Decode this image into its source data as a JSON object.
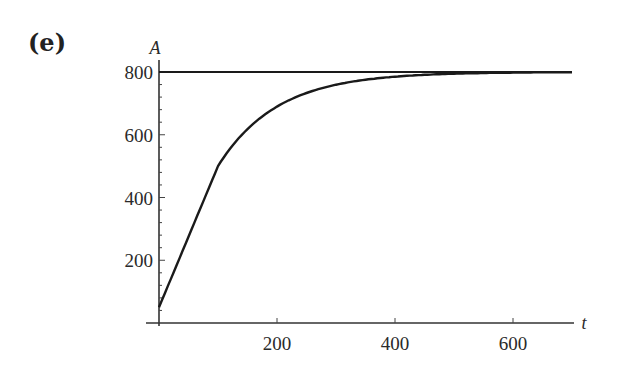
{
  "panel_label": "(e)",
  "chart_data": {
    "type": "line",
    "title": "",
    "xlabel": "t",
    "ylabel": "A",
    "xlim": [
      0,
      700
    ],
    "ylim": [
      0,
      800
    ],
    "x_ticks": [
      200,
      400,
      600
    ],
    "y_ticks": [
      200,
      400,
      600,
      800
    ],
    "x_tick_labels": [
      "200",
      "400",
      "600"
    ],
    "y_tick_labels": [
      "200",
      "400",
      "600",
      "800"
    ],
    "grid": false,
    "legend": null,
    "series": [
      {
        "name": "A(t)",
        "x": [
          0,
          25,
          50,
          75,
          100,
          125,
          150,
          200,
          250,
          300,
          350,
          400,
          450,
          500,
          550,
          600,
          650,
          700
        ],
        "values": [
          50,
          170,
          285,
          395,
          500,
          566,
          618,
          690,
          733,
          759,
          775,
          785,
          791,
          795,
          797,
          798,
          799,
          800
        ]
      },
      {
        "name": "A = 800 (asymptote)",
        "x": [
          0,
          700
        ],
        "values": [
          800,
          800
        ]
      }
    ]
  }
}
